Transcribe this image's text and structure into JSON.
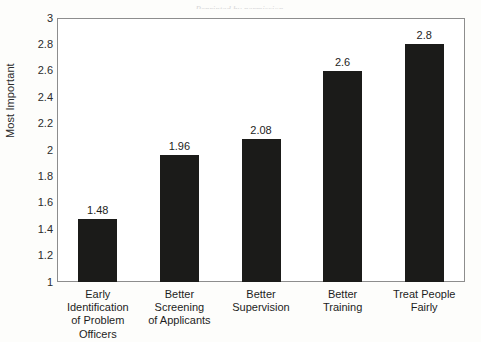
{
  "source_note": "Reprinted by permission.",
  "chart_data": {
    "type": "bar",
    "title": "",
    "xlabel": "",
    "ylabel": "Most Important",
    "categories": [
      "Early\nIdentification\nof Problem\nOfficers",
      "Better\nScreening\nof Applicants",
      "Better\nSupervision",
      "Better\nTraining",
      "Treat People\nFairly"
    ],
    "values": [
      1.48,
      1.96,
      2.08,
      2.6,
      2.8
    ],
    "value_labels": [
      "1.48",
      "1.96",
      "2.08",
      "2.6",
      "2.8"
    ],
    "ylim": [
      1,
      3
    ],
    "ytick_labels": [
      "3",
      "2.8",
      "2.6",
      "2.4",
      "2.2",
      "2",
      "1.8",
      "1.6",
      "1.4",
      "1.2",
      "1"
    ],
    "ytick_values": [
      3,
      2.8,
      2.6,
      2.4,
      2.2,
      2,
      1.8,
      1.6,
      1.4,
      1.2,
      1
    ],
    "grid": false,
    "legend": false,
    "bar_color": "#1b1b19",
    "frame_color": "#8d8d8d",
    "background": "#fdfdfb"
  }
}
